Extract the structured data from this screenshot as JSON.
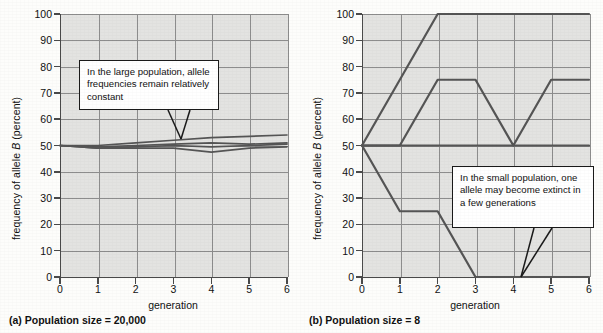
{
  "figure": {
    "panels": [
      {
        "id": "a",
        "caption": "(a) Population size = 20,000",
        "xlabel": "generation",
        "ylabel_prefix": "frequency of allele ",
        "ylabel_italic": "B",
        "ylabel_suffix": " (percent)",
        "callout": "In the large population, allele frequencies remain relatively constant"
      },
      {
        "id": "b",
        "caption": "(b) Population size = 8",
        "xlabel": "generation",
        "ylabel_prefix": "frequency of allele ",
        "ylabel_italic": "B",
        "ylabel_suffix": " (percent)",
        "callout": "In the small population, one allele may become extinct in a few generations"
      }
    ]
  },
  "chart_data": [
    {
      "type": "line",
      "panel": "a",
      "title": "(a) Population size = 20,000",
      "xlabel": "generation",
      "ylabel": "frequency of allele B (percent)",
      "xlim": [
        0,
        6
      ],
      "ylim": [
        0,
        100
      ],
      "xticks": [
        0,
        1,
        2,
        3,
        4,
        5,
        6
      ],
      "yticks": [
        0,
        10,
        20,
        30,
        40,
        50,
        60,
        70,
        80,
        90,
        100
      ],
      "grid": true,
      "legend": "none",
      "x": [
        0,
        1,
        2,
        3,
        4,
        5,
        6
      ],
      "series": [
        {
          "name": "replicate 1",
          "values": [
            50,
            50,
            51,
            52,
            53,
            53.5,
            54
          ]
        },
        {
          "name": "replicate 2",
          "values": [
            50,
            49.5,
            50,
            50.5,
            51,
            50.5,
            51
          ]
        },
        {
          "name": "replicate 3",
          "values": [
            50,
            49,
            49.5,
            50,
            49.5,
            50,
            50.5
          ]
        },
        {
          "name": "replicate 4",
          "values": [
            50,
            49,
            49,
            49,
            47.5,
            49,
            49.5
          ]
        }
      ],
      "annotations": [
        {
          "text": "In the large population, allele frequencies remain relatively constant",
          "points_to_x": 3.1,
          "points_to_y": 52
        }
      ]
    },
    {
      "type": "line",
      "panel": "b",
      "title": "(b) Population size = 8",
      "xlabel": "generation",
      "ylabel": "frequency of allele B (percent)",
      "xlim": [
        0,
        6
      ],
      "ylim": [
        0,
        100
      ],
      "xticks": [
        0,
        1,
        2,
        3,
        4,
        5,
        6
      ],
      "yticks": [
        0,
        10,
        20,
        30,
        40,
        50,
        60,
        70,
        80,
        90,
        100
      ],
      "grid": true,
      "legend": "none",
      "x": [
        0,
        1,
        2,
        3,
        4,
        5,
        6
      ],
      "series": [
        {
          "name": "replicate 1 (fixed at 100)",
          "values": [
            50,
            75,
            100,
            100,
            100,
            100,
            100
          ]
        },
        {
          "name": "replicate 2",
          "values": [
            50,
            50,
            75,
            75,
            50,
            75,
            75
          ]
        },
        {
          "name": "replicate 3 (constant)",
          "values": [
            50,
            50,
            50,
            50,
            50,
            50,
            50
          ]
        },
        {
          "name": "replicate 4 (extinct at 3)",
          "values": [
            50,
            25,
            25,
            0,
            0,
            0,
            0
          ]
        }
      ],
      "annotations": [
        {
          "text": "In the small population, one allele may become extinct in a few generations",
          "points_to_x": 4.85,
          "points_to_y": 0
        }
      ]
    }
  ],
  "colors": {
    "plot_background": "#e3e3e1",
    "grid": "#8d8d8d",
    "axis": "#4a4a4a",
    "data_line": "#555555",
    "text": "#111111",
    "callout_background": "#ffffff",
    "callout_border": "#1a1a1a"
  }
}
